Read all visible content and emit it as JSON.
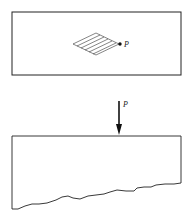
{
  "figure": {
    "top_view": {
      "description": "Plan view of half-space with loaded area",
      "point_label": "P",
      "hatch_lines": 5
    },
    "side_view": {
      "description": "Section of half-space with point load",
      "load_label": "P"
    },
    "colors": {
      "line": "#222222",
      "background": "#ffffff"
    }
  }
}
